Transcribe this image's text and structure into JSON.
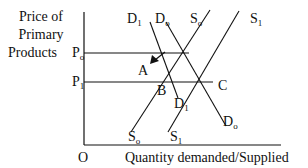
{
  "diagram": {
    "type": "supply-demand",
    "y_axis_label": [
      "Price of",
      "Primary",
      "Products"
    ],
    "x_axis_label": "Quantity demanded/Supplied",
    "origin_label": "O",
    "price_levels": [
      {
        "label": "P",
        "sub": "o"
      },
      {
        "label": "P",
        "sub": "1"
      }
    ],
    "curves": [
      {
        "label": "D",
        "sub": "1",
        "kind": "demand"
      },
      {
        "label": "D",
        "sub": "o",
        "kind": "demand"
      },
      {
        "label": "S",
        "sub": "o",
        "kind": "supply"
      },
      {
        "label": "S",
        "sub": "1",
        "kind": "supply"
      }
    ],
    "bottom_labels": [
      {
        "label": "S",
        "sub": "o"
      },
      {
        "label": "S",
        "sub": "1"
      },
      {
        "label": "D",
        "sub": "1"
      },
      {
        "label": "D",
        "sub": "o"
      }
    ],
    "points": {
      "A": "A",
      "B": "B",
      "C": "C"
    },
    "colors": {
      "line": "#111111",
      "background": "#ffffff"
    }
  }
}
